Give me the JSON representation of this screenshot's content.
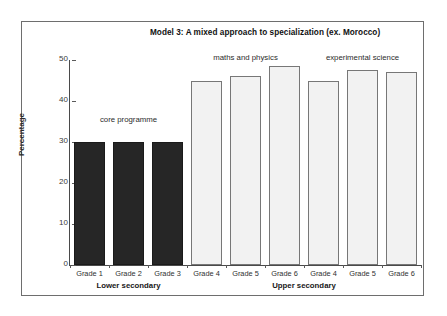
{
  "chart_data": {
    "type": "bar",
    "title": "Model 3: A mixed approach to specialization (ex. Morocco)",
    "xlabel": "",
    "ylabel": "Percentage",
    "ylim": [
      0,
      50
    ],
    "yticks": [
      0,
      10,
      20,
      30,
      40,
      50
    ],
    "ytick_labels": [
      "0",
      "10",
      "20",
      "30",
      "40",
      "50"
    ],
    "grid": false,
    "legend": "none",
    "categories": [
      "Grade 1",
      "Grade 2",
      "Grade 3",
      "Grade 4",
      "Grade 5",
      "Grade 6",
      "Grade 4",
      "Grade 5",
      "Grade 6"
    ],
    "values": [
      30,
      30,
      30,
      45,
      46,
      48.5,
      45,
      47.5,
      47
    ],
    "bar_styles": [
      "dark",
      "dark",
      "dark",
      "light",
      "light",
      "light",
      "light",
      "light",
      "light"
    ],
    "colors": {
      "dark_bar": "#262626",
      "light_bar": "#f2f2f2",
      "light_bar_border": "#777777",
      "axis": "#4a4a4a",
      "frame": "#6e6e6e",
      "text": "#2b2b2b"
    },
    "annotations": [
      {
        "text": "core programme",
        "near_categories": [
          "Grade 1",
          "Grade 2",
          "Grade 3"
        ]
      },
      {
        "text": "maths and physics",
        "near_categories": [
          "Grade 4",
          "Grade 5",
          "Grade 6"
        ]
      },
      {
        "text": "experimental science",
        "near_categories": [
          "Grade 4",
          "Grade 5",
          "Grade 6"
        ]
      }
    ],
    "group_labels": [
      "Lower secondary",
      "Upper secondary"
    ]
  }
}
